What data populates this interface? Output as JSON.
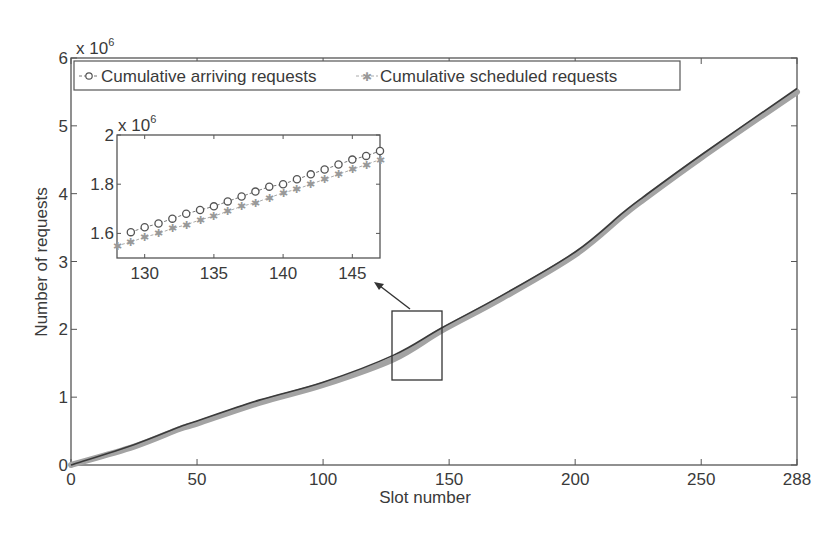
{
  "chart_data": [
    {
      "id": "main",
      "type": "line",
      "title": "",
      "xlabel": "Slot number",
      "ylabel": "Number of requests",
      "y_exponent_label": "x 10^6",
      "xlim": [
        0,
        288
      ],
      "ylim": [
        0,
        6000000
      ],
      "x_ticks": [
        0,
        50,
        100,
        150,
        200,
        250,
        288
      ],
      "y_ticks": [
        0,
        1,
        2,
        3,
        4,
        5,
        6
      ],
      "grid": false,
      "legend": {
        "position": "top, inside plot, horizontal",
        "entries": [
          "Cumulative arriving requests",
          "Cumulative scheduled requests"
        ]
      },
      "x": [
        0,
        25,
        43,
        50,
        75,
        100,
        128,
        147,
        171,
        200,
        219,
        227,
        250,
        288
      ],
      "series": [
        {
          "name": "Cumulative arriving requests",
          "marker": "circle",
          "color": "#2b2b2b",
          "values": [
            0,
            300000,
            560000,
            650000,
            960000,
            1220000,
            1620000,
            2020000,
            2500000,
            3140000,
            3720000,
            3950000,
            4570000,
            5550000
          ]
        },
        {
          "name": "Cumulative scheduled requests",
          "marker": "star",
          "color": "#9a9a9a",
          "values": [
            0,
            270000,
            530000,
            610000,
            920000,
            1180000,
            1560000,
            1980000,
            2460000,
            3100000,
            3680000,
            3910000,
            4530000,
            5500000
          ]
        }
      ],
      "annotations": [
        {
          "type": "rectangle",
          "x_range": [
            128,
            147
          ],
          "y_range": [
            1250000,
            2280000
          ],
          "label": "zoom region"
        },
        {
          "type": "arrow",
          "from": "zoom region",
          "to": "inset"
        }
      ]
    },
    {
      "id": "inset",
      "type": "line",
      "title": "",
      "xlabel": "",
      "ylabel": "",
      "y_exponent_label": "x 10^6",
      "xlim": [
        128,
        147
      ],
      "ylim": [
        1500000,
        2000000
      ],
      "x_ticks": [
        130,
        135,
        140,
        145
      ],
      "y_ticks": [
        1.6,
        1.8,
        2
      ],
      "grid": false,
      "x": [
        128,
        129,
        130,
        131,
        132,
        133,
        134,
        135,
        136,
        137,
        138,
        139,
        140,
        141,
        142,
        143,
        144,
        145,
        146,
        147
      ],
      "series": [
        {
          "name": "Cumulative arriving requests",
          "marker": "circle",
          "values": [
            1585000,
            1605000,
            1625000,
            1640000,
            1660000,
            1680000,
            1695000,
            1710000,
            1730000,
            1750000,
            1770000,
            1790000,
            1800000,
            1820000,
            1840000,
            1860000,
            1880000,
            1900000,
            1915000,
            1935000
          ]
        },
        {
          "name": "Cumulative scheduled requests",
          "marker": "star",
          "values": [
            1550000,
            1565000,
            1585000,
            1600000,
            1620000,
            1635000,
            1655000,
            1670000,
            1690000,
            1710000,
            1725000,
            1745000,
            1765000,
            1780000,
            1800000,
            1820000,
            1840000,
            1860000,
            1880000,
            1900000
          ]
        }
      ]
    }
  ],
  "labels": {
    "xlabel": "Slot number",
    "ylabel": "Number of requests",
    "exp_base": "x 10",
    "exp_power": "6",
    "legend_arriving": "Cumulative arriving requests",
    "legend_scheduled": "Cumulative scheduled requests",
    "main_x_ticks": [
      "0",
      "50",
      "100",
      "150",
      "200",
      "250",
      "288"
    ],
    "main_y_ticks": [
      "0",
      "1",
      "2",
      "3",
      "4",
      "5",
      "6"
    ],
    "inset_x_ticks": [
      "130",
      "135",
      "140",
      "145"
    ],
    "inset_y_ticks": [
      "1.6",
      "1.8",
      "2"
    ]
  }
}
